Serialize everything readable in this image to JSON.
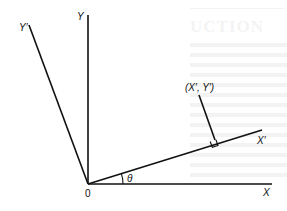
{
  "diagram": {
    "title": "",
    "origin": {
      "label": "0",
      "x": 88,
      "y": 184
    },
    "axes": [
      {
        "id": "X",
        "label": "X",
        "from": [
          88,
          184
        ],
        "to": [
          272,
          184
        ]
      },
      {
        "id": "Y",
        "label": "Y",
        "from": [
          88,
          184
        ],
        "to": [
          88,
          15
        ]
      },
      {
        "id": "X_prime",
        "label": "X′",
        "from": [
          88,
          184
        ],
        "to": [
          262,
          130
        ]
      },
      {
        "id": "Y_prime",
        "label": "Y′",
        "from": [
          88,
          184
        ],
        "to": [
          29,
          25
        ]
      }
    ],
    "point": {
      "label": "(X′, Y′)",
      "perpendicular_from": [
        199,
        95
      ],
      "perpendicular_to": [
        215,
        140
      ]
    },
    "angle": {
      "label": "θ",
      "between": [
        "X",
        "X_prime"
      ]
    },
    "right_angle_marker": true
  },
  "labels": {
    "x": "X",
    "y": "Y",
    "x_prime": "X′",
    "y_prime": "Y′",
    "origin": "0",
    "theta": "θ",
    "point": "(X′, Y′)"
  },
  "bleed_through": {
    "heading": "UCTION"
  }
}
